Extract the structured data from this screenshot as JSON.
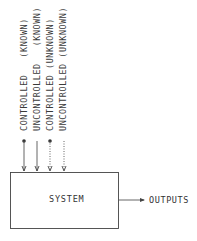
{
  "diagram": {
    "inputs": [
      {
        "label": "CONTROLLED   (KNOWN)",
        "line_style": "solid",
        "source_dot": true
      },
      {
        "label": "UNCONTROLLED   (KNOWN)",
        "line_style": "solid",
        "source_dot": false
      },
      {
        "label": "CONTROLLED (UNKNOWN)",
        "line_style": "dotted",
        "source_dot": true
      },
      {
        "label": "UNCONTROLLED (UNKNOWN)",
        "line_style": "dotted",
        "source_dot": false
      }
    ],
    "system_label": "SYSTEM",
    "output_label": "OUTPUTS",
    "colors": {
      "line": "#444444",
      "background": "#ffffff"
    }
  }
}
